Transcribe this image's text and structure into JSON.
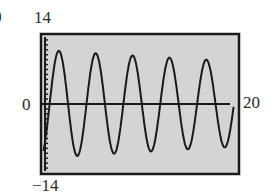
{
  "figure": {
    "label_prefix": ")",
    "window": {
      "xmin": 0,
      "xmax": 20,
      "ymin": -14,
      "ymax": 14
    },
    "labels": {
      "ymax": "14",
      "ymin": "−14",
      "xmin": "0",
      "xmax": "20"
    },
    "colors": {
      "frame": "#1a1a1a",
      "screen": "#d4d4d4",
      "curve": "#1a1a1a",
      "axis": "#1a1a1a"
    }
  },
  "chart_data": {
    "type": "line",
    "title": "",
    "xlabel": "",
    "ylabel": "",
    "xlim": [
      0,
      20
    ],
    "ylim": [
      -14,
      14
    ],
    "grid": false,
    "legend": null,
    "y_ticks_every": 1,
    "series": [
      {
        "name": "y(x)",
        "model": "A*e^(-k x)*sin(w x + phi)",
        "approx_params": {
          "A": 11,
          "k": 0.012,
          "w": 1.67,
          "phi": -1.3
        },
        "peaks": [
          {
            "x": 2.2,
            "y": 10.5
          },
          {
            "x": 6.0,
            "y": 10.0
          },
          {
            "x": 9.8,
            "y": 9.5
          },
          {
            "x": 13.5,
            "y": 9.2
          },
          {
            "x": 17.3,
            "y": 8.8
          }
        ],
        "troughs": [
          {
            "x": 0.1,
            "y": -10.5
          },
          {
            "x": 4.1,
            "y": -10.3
          },
          {
            "x": 7.9,
            "y": -9.8
          },
          {
            "x": 11.6,
            "y": -9.4
          },
          {
            "x": 15.4,
            "y": -8.7
          },
          {
            "x": 19.6,
            "y": -8.0
          }
        ]
      }
    ]
  }
}
